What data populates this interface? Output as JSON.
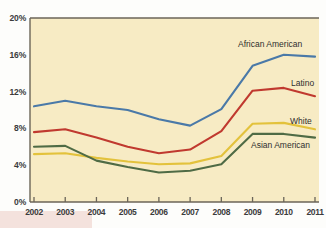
{
  "chart_data": {
    "type": "line",
    "title": "",
    "subtitle": "",
    "xlabel": "",
    "ylabel": "",
    "grid": false,
    "legend_position": "inline-right",
    "x": [
      "2002",
      "2003",
      "2004",
      "2005",
      "2006",
      "2007",
      "2008",
      "2009",
      "2010",
      "2011"
    ],
    "ylim": [
      0,
      20
    ],
    "yticks": [
      "0%",
      "4%",
      "8%",
      "12%",
      "16%",
      "20%"
    ],
    "ytick_values": [
      0,
      4,
      8,
      12,
      16,
      20
    ],
    "series": [
      {
        "name": "African American",
        "color": "#4a79a8",
        "values": [
          10.4,
          11.0,
          10.4,
          10.0,
          9.0,
          8.3,
          10.1,
          14.8,
          16.0,
          15.8
        ]
      },
      {
        "name": "Latino",
        "color": "#c0392f",
        "values": [
          7.6,
          7.9,
          7.0,
          6.0,
          5.3,
          5.7,
          7.7,
          12.1,
          12.4,
          11.5
        ]
      },
      {
        "name": "White",
        "color": "#e3c23c",
        "values": [
          5.2,
          5.3,
          4.8,
          4.4,
          4.1,
          4.2,
          5.0,
          8.5,
          8.6,
          7.9
        ]
      },
      {
        "name": "Asian American",
        "color": "#4f6b45",
        "values": [
          6.0,
          6.1,
          4.5,
          3.8,
          3.2,
          3.4,
          4.1,
          7.4,
          7.4,
          7.0
        ]
      }
    ],
    "series_label_positions": [
      {
        "name": "African American",
        "x": 238,
        "y": 39
      },
      {
        "name": "Latino",
        "x": 291,
        "y": 78
      },
      {
        "name": "White",
        "x": 290,
        "y": 116
      },
      {
        "name": "Asian American",
        "x": 251,
        "y": 140
      }
    ],
    "colors": {
      "plot_background": "#f7ebc4",
      "page_background": "#fdfdfb",
      "axis": "#6b6558",
      "tick_text": "#3b3b3b",
      "accent_band": "#f4e2dd"
    }
  }
}
